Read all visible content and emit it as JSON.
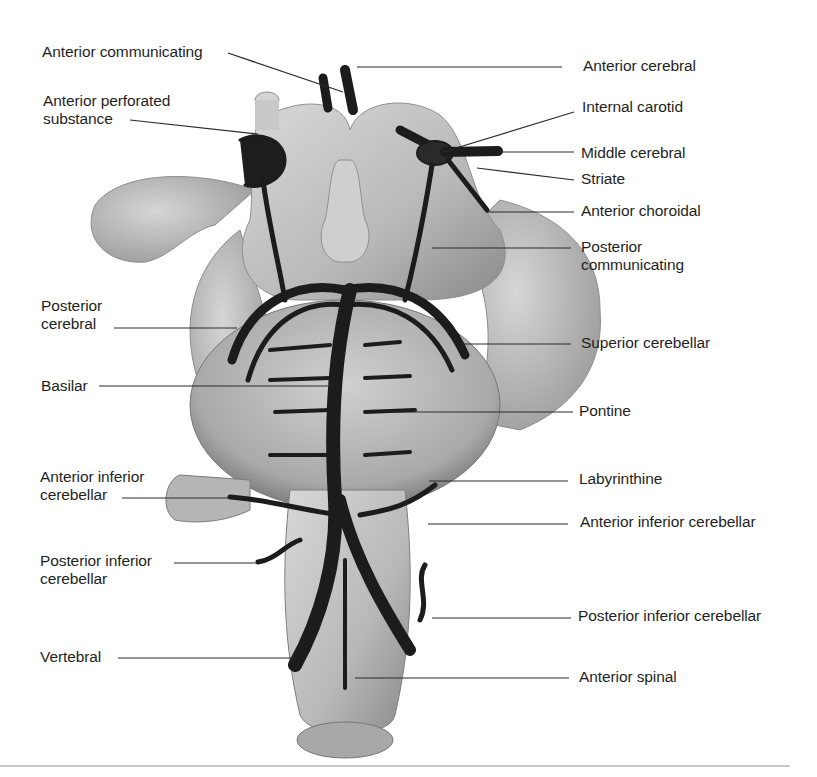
{
  "figure": {
    "type": "anatomical-illustration",
    "colors": {
      "tissue": "#c4c4c4",
      "tissue_dark": "#8e8e8e",
      "vessel": "#1c1c1c",
      "leader": "#2a2a2a",
      "rule": "#c9c9c9"
    }
  },
  "labels": {
    "left": [
      {
        "id": "anterior-communicating",
        "text": "Anterior communicating"
      },
      {
        "id": "anterior-perforated-substance",
        "text": "Anterior perforated\nsubstance"
      },
      {
        "id": "posterior-cerebral",
        "text": "Posterior\ncerebral"
      },
      {
        "id": "basilar",
        "text": "Basilar"
      },
      {
        "id": "anterior-inferior-cerebellar-left",
        "text": "Anterior inferior\ncerebellar"
      },
      {
        "id": "posterior-inferior-cerebellar-left",
        "text": "Posterior inferior\ncerebellar"
      },
      {
        "id": "vertebral",
        "text": "Vertebral"
      }
    ],
    "right": [
      {
        "id": "anterior-cerebral",
        "text": "Anterior cerebral"
      },
      {
        "id": "internal-carotid",
        "text": "Internal carotid"
      },
      {
        "id": "middle-cerebral",
        "text": "Middle cerebral"
      },
      {
        "id": "striate",
        "text": "Striate"
      },
      {
        "id": "anterior-choroidal",
        "text": "Anterior choroidal"
      },
      {
        "id": "posterior-communicating",
        "text": "Posterior\ncommunicating"
      },
      {
        "id": "superior-cerebellar",
        "text": "Superior cerebellar"
      },
      {
        "id": "pontine",
        "text": "Pontine"
      },
      {
        "id": "labyrinthine",
        "text": "Labyrinthine"
      },
      {
        "id": "anterior-inferior-cerebellar-right",
        "text": "Anterior inferior cerebellar"
      },
      {
        "id": "posterior-inferior-cerebellar-right",
        "text": "Posterior inferior cerebellar"
      },
      {
        "id": "anterior-spinal",
        "text": "Anterior spinal"
      }
    ]
  }
}
